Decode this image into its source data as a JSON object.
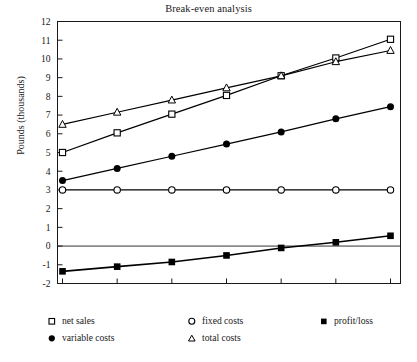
{
  "chart_data": {
    "type": "line",
    "title": "Break-even analysis",
    "xlabel": "",
    "ylabel": "Pounds (thousands)",
    "ylim": [
      -2,
      12
    ],
    "ytick_labels": [
      "12",
      "11",
      "10",
      "9",
      "8",
      "7",
      "6",
      "5",
      "4",
      "3",
      "2",
      "1",
      "0",
      "-1",
      "-2"
    ],
    "yticks": [
      12,
      11,
      10,
      9,
      8,
      7,
      6,
      5,
      4,
      3,
      2,
      1,
      0,
      -1,
      -2
    ],
    "x": [
      1,
      2,
      3,
      4,
      5,
      6,
      7
    ],
    "xtick_labels": [
      "",
      "",
      "",
      "",
      "",
      "",
      ""
    ],
    "grid": false,
    "zero_line": true,
    "legend_position": "below",
    "series": [
      {
        "name": "net sales",
        "marker": "open-square",
        "values": [
          5.0,
          6.05,
          7.05,
          8.05,
          9.1,
          10.05,
          11.05
        ]
      },
      {
        "name": "variable costs",
        "marker": "filled-circle",
        "values": [
          3.5,
          4.15,
          4.8,
          5.45,
          6.1,
          6.8,
          7.45
        ]
      },
      {
        "name": "fixed costs",
        "marker": "open-circle",
        "values": [
          3.0,
          3.0,
          3.0,
          3.0,
          3.0,
          3.0,
          3.0
        ]
      },
      {
        "name": "total costs",
        "marker": "open-triangle",
        "values": [
          6.5,
          7.15,
          7.8,
          8.45,
          9.1,
          9.85,
          10.45
        ]
      },
      {
        "name": "profit/loss",
        "marker": "filled-square",
        "values": [
          -1.35,
          -1.1,
          -0.85,
          -0.5,
          -0.1,
          0.2,
          0.55
        ]
      }
    ]
  },
  "chart": {
    "title": "Break-even analysis",
    "y_axis_title": "Pounds (thousands)"
  },
  "legend": {
    "columns": [
      {
        "entries": [
          {
            "label": "net sales",
            "marker": "open-square"
          },
          {
            "label": "variable costs",
            "marker": "filled-circle"
          }
        ]
      },
      {
        "entries": [
          {
            "label": "fixed costs",
            "marker": "open-circle"
          },
          {
            "label": "total costs",
            "marker": "open-triangle"
          }
        ]
      },
      {
        "entries": [
          {
            "label": "profit/loss",
            "marker": "filled-square"
          }
        ]
      }
    ]
  },
  "colors": {
    "line": "#000000",
    "frame": "#1a1a1a",
    "text": "#1a1a1a",
    "background": "#ffffff"
  }
}
